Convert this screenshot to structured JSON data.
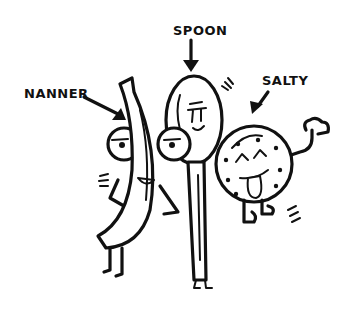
{
  "illustration": {
    "style": "hand-drawn black ink cartoon on white",
    "background": "#ffffff",
    "ink_color": "#111111",
    "characters": [
      {
        "id": "nanner",
        "label": "NANNER",
        "kind": "banana with two round eyes"
      },
      {
        "id": "spoon",
        "label": "SPOON",
        "kind": "spoon with smiling face"
      },
      {
        "id": "salty",
        "label": "SALTY",
        "kind": "round cookie/pretzel with tongue out, waving arm"
      }
    ]
  }
}
